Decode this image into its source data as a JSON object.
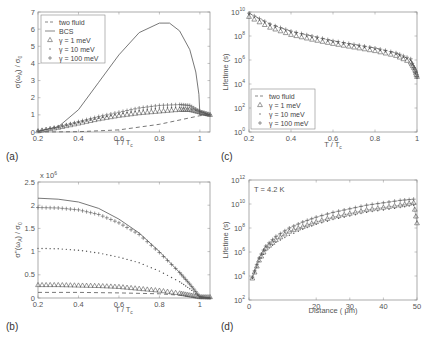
{
  "chart_data": [
    {
      "panel": "(a)",
      "type": "line",
      "xlabel": "T / T_c",
      "ylabel": "σ(ω_A) / σ_0",
      "xlim": [
        0.2,
        1.05
      ],
      "ylim": [
        0,
        7
      ],
      "xticks": [
        "0.2",
        "0.4",
        "0.6",
        "0.8",
        "1"
      ],
      "yticks": [
        "0",
        "1",
        "2",
        "3",
        "4",
        "5",
        "6",
        "7"
      ],
      "legend": [
        "two fluid",
        "BCS",
        "γ =   1 meV",
        "γ =  10 meV",
        "γ = 100 meV"
      ],
      "legend_position": "upper left",
      "series": [
        {
          "name": "two fluid",
          "style": "dashed",
          "x": [
            0.2,
            0.4,
            0.6,
            0.8,
            1.0,
            1.05
          ],
          "y": [
            0.0,
            0.02,
            0.12,
            0.45,
            0.95,
            1.0
          ]
        },
        {
          "name": "BCS",
          "style": "solid",
          "x": [
            0.2,
            0.3,
            0.4,
            0.5,
            0.6,
            0.7,
            0.8,
            0.85,
            0.9,
            0.95,
            0.98,
            0.995,
            1.0,
            1.05
          ],
          "y": [
            0.05,
            0.3,
            1.3,
            2.9,
            4.5,
            5.8,
            6.35,
            6.35,
            5.9,
            4.8,
            3.5,
            2.2,
            1.0,
            1.0
          ]
        },
        {
          "name": "γ = 1 meV",
          "style": "triangle",
          "x": [
            0.2,
            0.3,
            0.4,
            0.5,
            0.6,
            0.7,
            0.8,
            0.9,
            0.95,
            1.0,
            1.05
          ],
          "y": [
            0.05,
            0.25,
            0.5,
            0.75,
            0.95,
            1.1,
            1.2,
            1.3,
            1.3,
            1.15,
            1.0
          ]
        },
        {
          "name": "γ = 10 meV",
          "style": "dot",
          "x": [
            0.2,
            0.3,
            0.4,
            0.5,
            0.6,
            0.7,
            0.8,
            0.9,
            1.0,
            1.05
          ],
          "y": [
            0.05,
            0.25,
            0.55,
            0.8,
            1.05,
            1.25,
            1.4,
            1.45,
            1.2,
            1.0
          ]
        },
        {
          "name": "γ = 100 meV",
          "style": "plus",
          "x": [
            0.2,
            0.3,
            0.4,
            0.5,
            0.6,
            0.7,
            0.8,
            0.9,
            0.95,
            1.0,
            1.05
          ],
          "y": [
            0.05,
            0.3,
            0.6,
            0.9,
            1.15,
            1.4,
            1.55,
            1.6,
            1.55,
            1.2,
            1.0
          ]
        }
      ]
    },
    {
      "panel": "(c)",
      "type": "line",
      "xlabel": "T / T_c",
      "ylabel": "Lifetime (s)",
      "yscale": "log",
      "xlim": [
        0.2,
        1.0
      ],
      "ylim_exp": [
        0,
        10
      ],
      "xticks": [
        "0.2",
        "0.4",
        "0.6",
        "0.8",
        "1"
      ],
      "yticks": [
        "10^0",
        "10^2",
        "10^4",
        "10^6",
        "10^8",
        "10^10"
      ],
      "legend": [
        "two fluid",
        "γ =   1 meV",
        "γ =  10 meV",
        "γ = 100 meV"
      ],
      "legend_position": "lower left",
      "series": [
        {
          "name": "two fluid",
          "style": "dashed",
          "x": [
            0.2,
            0.3,
            0.4,
            0.5,
            0.6,
            0.7,
            0.8,
            0.9,
            0.97,
            1.0
          ],
          "y_exp": [
            9.9,
            9.0,
            8.4,
            8.0,
            7.6,
            7.3,
            7.0,
            6.6,
            6.0,
            5.0
          ]
        },
        {
          "name": "γ = 1 meV",
          "style": "triangle",
          "x": [
            0.2,
            0.3,
            0.4,
            0.5,
            0.6,
            0.7,
            0.8,
            0.9,
            0.97,
            0.99,
            1.0
          ],
          "y_exp": [
            9.6,
            8.7,
            8.1,
            7.7,
            7.35,
            7.05,
            6.75,
            6.35,
            5.8,
            5.2,
            4.6
          ]
        },
        {
          "name": "γ = 10 meV",
          "style": "dot",
          "x": [
            0.2,
            0.3,
            0.4,
            0.5,
            0.6,
            0.7,
            0.8,
            0.9,
            0.97,
            1.0
          ],
          "y_exp": [
            9.8,
            8.9,
            8.3,
            7.9,
            7.5,
            7.2,
            6.9,
            6.5,
            6.0,
            4.5
          ]
        },
        {
          "name": "γ = 100 meV",
          "style": "plus",
          "x": [
            0.2,
            0.3,
            0.4,
            0.5,
            0.6,
            0.7,
            0.8,
            0.9,
            0.97,
            1.0
          ],
          "y_exp": [
            9.9,
            9.0,
            8.4,
            8.0,
            7.6,
            7.3,
            7.0,
            6.6,
            6.1,
            4.6
          ]
        }
      ]
    },
    {
      "panel": "(b)",
      "type": "line",
      "xlabel": "T / T_c",
      "ylabel": "σ''(ω_A) / σ_0",
      "multiplier": "x 10^6",
      "xlim": [
        0.2,
        1.05
      ],
      "ylim": [
        0,
        2.5
      ],
      "xticks": [
        "0.2",
        "0.4",
        "0.6",
        "0.8",
        "1"
      ],
      "yticks": [
        "0",
        "0.5",
        "1",
        "1.5",
        "2",
        "2.5"
      ],
      "series": [
        {
          "name": "BCS",
          "style": "solid",
          "x": [
            0.2,
            0.3,
            0.4,
            0.5,
            0.6,
            0.7,
            0.8,
            0.9,
            0.95,
            1.0,
            1.05
          ],
          "y": [
            2.15,
            2.13,
            2.07,
            1.93,
            1.7,
            1.4,
            1.0,
            0.55,
            0.3,
            0.02,
            0.0
          ]
        },
        {
          "name": "γ = 100 meV",
          "style": "plus",
          "x": [
            0.2,
            0.3,
            0.4,
            0.5,
            0.6,
            0.7,
            0.8,
            0.9,
            0.95,
            1.0,
            1.05
          ],
          "y": [
            1.95,
            1.94,
            1.9,
            1.8,
            1.62,
            1.37,
            0.98,
            0.55,
            0.3,
            0.03,
            0.0
          ]
        },
        {
          "name": "γ = 10 meV",
          "style": "dot",
          "x": [
            0.2,
            0.3,
            0.4,
            0.5,
            0.6,
            0.7,
            0.8,
            0.9,
            0.95,
            1.0,
            1.05
          ],
          "y": [
            1.07,
            1.06,
            1.03,
            0.97,
            0.88,
            0.76,
            0.58,
            0.35,
            0.2,
            0.02,
            0.0
          ]
        },
        {
          "name": "γ = 1 meV",
          "style": "triangle",
          "x": [
            0.2,
            0.3,
            0.4,
            0.5,
            0.6,
            0.7,
            0.8,
            0.9,
            0.95,
            1.0,
            1.05
          ],
          "y": [
            0.28,
            0.28,
            0.27,
            0.26,
            0.24,
            0.2,
            0.16,
            0.1,
            0.06,
            0.02,
            0.02
          ]
        },
        {
          "name": "two fluid",
          "style": "dashed",
          "x": [
            0.2,
            0.4,
            0.6,
            0.8,
            0.9,
            1.0,
            1.05
          ],
          "y": [
            0.12,
            0.12,
            0.11,
            0.09,
            0.06,
            0.0,
            0.0
          ]
        }
      ]
    },
    {
      "panel": "(d)",
      "type": "line",
      "annotation": "T = 4.2 K",
      "xlabel": "Distance ( μm)",
      "ylabel": "Lifetime (s)",
      "yscale": "log",
      "xlim": [
        0,
        50
      ],
      "ylim_exp": [
        2,
        12
      ],
      "xticks": [
        "0",
        "20",
        "30",
        "40",
        "50"
      ],
      "yticks": [
        "10^2",
        "10^4",
        "10^6",
        "10^8",
        "10^10",
        "10^12"
      ],
      "series": [
        {
          "name": "γ = 1 meV",
          "style": "triangle",
          "x": [
            1,
            3,
            5,
            8,
            12,
            16,
            20,
            25,
            30,
            35,
            40,
            45,
            49,
            50
          ],
          "y_exp": [
            3.8,
            5.3,
            6.3,
            7.0,
            7.7,
            8.1,
            8.5,
            8.9,
            9.2,
            9.5,
            9.7,
            9.9,
            10.1,
            8.4
          ]
        },
        {
          "name": "γ = 100 meV",
          "style": "plus",
          "x": [
            1,
            3,
            5,
            8,
            12,
            16,
            20,
            25,
            30,
            35,
            40,
            45,
            49
          ],
          "y_exp": [
            3.9,
            5.5,
            6.5,
            7.3,
            8.0,
            8.5,
            8.9,
            9.3,
            9.6,
            9.9,
            10.1,
            10.3,
            10.4
          ]
        },
        {
          "name": "γ = 10 meV",
          "style": "dot",
          "x": [
            1,
            3,
            5,
            8,
            12,
            16,
            20,
            25,
            30,
            35,
            40,
            45,
            49
          ],
          "y_exp": [
            3.8,
            5.2,
            6.1,
            6.8,
            7.4,
            7.9,
            8.3,
            8.7,
            9.0,
            9.3,
            9.5,
            9.7,
            9.9
          ]
        }
      ]
    }
  ],
  "panels": {
    "a": {
      "label": "(a)",
      "xlabel": "T / T",
      "xlabel_sub": "c",
      "ylabel": "σ(ω  ) / σ"
    },
    "b": {
      "label": "(b)",
      "xlabel": "T / T",
      "xlabel_sub": "c",
      "multiplier": "x 10",
      "multiplier_exp": "6"
    },
    "c": {
      "label": "(c)",
      "xlabel": "T / T",
      "xlabel_sub": "c",
      "ylabel": "Lifetime (s)"
    },
    "d": {
      "label": "(d)",
      "xlabel": "Distance ( μm)",
      "ylabel": "Lifetime (s)",
      "annotation": "T = 4.2 K"
    }
  },
  "legends": {
    "a": [
      {
        "symbol": "dashed",
        "text": "two fluid"
      },
      {
        "symbol": "solid",
        "text": "BCS"
      },
      {
        "symbol": "triangle",
        "text": "γ =     1 meV"
      },
      {
        "symbol": "dot",
        "text": "γ =   10 meV"
      },
      {
        "symbol": "plus",
        "text": "γ = 100 meV"
      }
    ],
    "c": [
      {
        "symbol": "dashed",
        "text": "two fluid"
      },
      {
        "symbol": "triangle",
        "text": "γ =     1 meV"
      },
      {
        "symbol": "dot",
        "text": "γ =   10 meV"
      },
      {
        "symbol": "plus",
        "text": "γ = 100 meV"
      }
    ]
  },
  "colors": {
    "line": "#555555",
    "axis": "#888888",
    "text": "#555555"
  }
}
